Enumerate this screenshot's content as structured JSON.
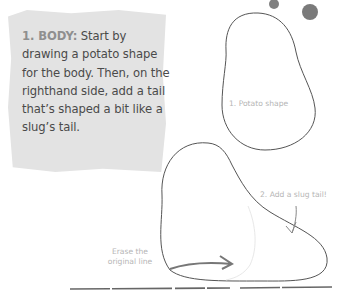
{
  "instruction": {
    "heading": "1. BODY:",
    "body": " Start by drawing a potato shape for the body. Then, on the righthand side, add a tail that’s shaped a bit like a slug’s tail."
  },
  "annotations": {
    "potato_shape": "1. Potato shape",
    "slug_tail": "2. Add a slug tail!",
    "erase_line_1": "Erase the",
    "erase_line_2": "original line"
  },
  "colors": {
    "note_background": "#e3e3e3",
    "heading": "#8f8f8f",
    "body_text": "#4a4a4a",
    "outline": "#555555",
    "annotation": "#b5b5b5",
    "paint_dots": "#808080"
  }
}
